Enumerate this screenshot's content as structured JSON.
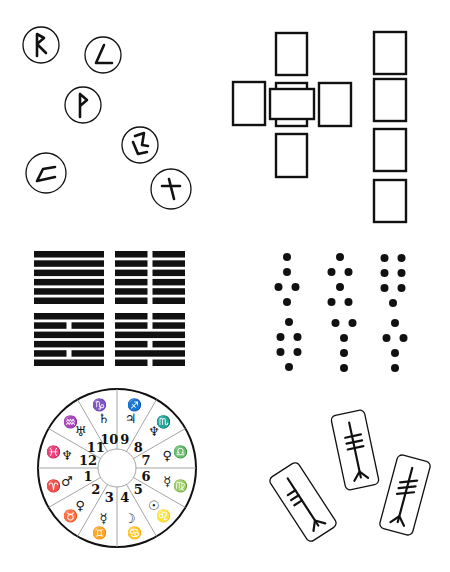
{
  "colors": {
    "ink": "#111111",
    "line": "#1a1a1a",
    "divider": "#9a9a9a",
    "background": "#ffffff"
  },
  "runes": {
    "panel_label": "rune-stones",
    "stones": [
      {
        "name": "raidho",
        "glyph": "ᚱ",
        "cx": 41,
        "cy": 45,
        "r": 18
      },
      {
        "name": "laguz-variant",
        "glyph": "ᚳ",
        "cx": 103,
        "cy": 55,
        "r": 18
      },
      {
        "name": "wunjo",
        "glyph": "ᚹ",
        "cx": 83,
        "cy": 105,
        "r": 18
      },
      {
        "name": "dagaz-variant",
        "glyph": "ᛞ",
        "cx": 140,
        "cy": 145,
        "r": 18
      },
      {
        "name": "kenaz-variant",
        "glyph": "ᚲ",
        "cx": 46,
        "cy": 173,
        "r": 20
      },
      {
        "name": "gebo",
        "glyph": "ᚷ",
        "cx": 171,
        "cy": 189,
        "r": 20
      }
    ]
  },
  "tarot": {
    "panel_label": "celtic-cross-spread",
    "cross_cards": [
      {
        "position": "top",
        "x": 276,
        "y": 33,
        "w": 31,
        "h": 42
      },
      {
        "position": "left",
        "x": 233,
        "y": 82,
        "w": 32,
        "h": 43
      },
      {
        "position": "center",
        "x": 276,
        "y": 83,
        "w": 31,
        "h": 43
      },
      {
        "position": "crossing",
        "x": 270,
        "y": 89,
        "w": 44,
        "h": 30
      },
      {
        "position": "right",
        "x": 319,
        "y": 83,
        "w": 32,
        "h": 43
      },
      {
        "position": "bottom",
        "x": 276,
        "y": 134,
        "w": 31,
        "h": 43
      }
    ],
    "staff_cards": [
      {
        "position": "staff-1",
        "x": 374,
        "y": 32,
        "w": 32,
        "h": 42
      },
      {
        "position": "staff-2",
        "x": 374,
        "y": 79,
        "w": 32,
        "h": 42
      },
      {
        "position": "staff-3",
        "x": 374,
        "y": 129,
        "w": 32,
        "h": 42
      },
      {
        "position": "staff-4",
        "x": 374,
        "y": 180,
        "w": 32,
        "h": 42
      }
    ]
  },
  "iching": {
    "panel_label": "i-ching-hexagrams",
    "hexagrams": [
      {
        "name": "qian",
        "x": 34,
        "y": 251,
        "lines": [
          "solid",
          "solid",
          "solid",
          "solid",
          "solid",
          "solid"
        ]
      },
      {
        "name": "kun",
        "x": 115,
        "y": 251,
        "lines": [
          "broken",
          "broken",
          "broken",
          "broken",
          "broken",
          "broken"
        ]
      },
      {
        "name": "li",
        "x": 34,
        "y": 313,
        "lines": [
          "solid",
          "broken",
          "solid",
          "solid",
          "broken",
          "solid"
        ]
      },
      {
        "name": "hexagram-broken-mix",
        "x": 115,
        "y": 313,
        "lines": [
          "broken",
          "broken",
          "solid",
          "broken",
          "solid",
          "broken"
        ]
      }
    ]
  },
  "geomancy": {
    "panel_label": "geomantic-figures",
    "figures": [
      {
        "name": "figure-1",
        "cx": 287,
        "cy": 257,
        "rows": [
          1,
          1,
          2,
          1
        ]
      },
      {
        "name": "figure-2",
        "cx": 340,
        "cy": 257,
        "rows": [
          1,
          2,
          1,
          2
        ]
      },
      {
        "name": "figure-3",
        "cx": 393,
        "cy": 258,
        "rows": [
          2,
          2,
          2,
          1
        ]
      },
      {
        "name": "figure-4",
        "cx": 289,
        "cy": 322,
        "rows": [
          1,
          2,
          2,
          1
        ]
      },
      {
        "name": "figure-5",
        "cx": 344,
        "cy": 323,
        "rows": [
          2,
          1,
          1,
          1
        ]
      },
      {
        "name": "figure-6",
        "cx": 395,
        "cy": 323,
        "rows": [
          1,
          2,
          1,
          1
        ]
      }
    ]
  },
  "astrology": {
    "panel_label": "natal-chart-wheel",
    "center": {
      "x": 117,
      "y": 468
    },
    "outer_radius": 79,
    "inner_radius": 19,
    "houses": [
      {
        "number": "1",
        "sign": "♈",
        "planet": "♂"
      },
      {
        "number": "2",
        "sign": "♉",
        "planet": "♀"
      },
      {
        "number": "3",
        "sign": "♊",
        "planet": "☿"
      },
      {
        "number": "4",
        "sign": "♋",
        "planet": "☽"
      },
      {
        "number": "5",
        "sign": "♌",
        "planet": "☉"
      },
      {
        "number": "6",
        "sign": "♍",
        "planet": "☿"
      },
      {
        "number": "7",
        "sign": "♎",
        "planet": "♀"
      },
      {
        "number": "8",
        "sign": "♏",
        "planet": "♆"
      },
      {
        "number": "9",
        "sign": "♐",
        "planet": "♃"
      },
      {
        "number": "10",
        "sign": "♑",
        "planet": "♄"
      },
      {
        "number": "11",
        "sign": "♒",
        "planet": "♅"
      },
      {
        "number": "12",
        "sign": "♓",
        "planet": "♆"
      }
    ]
  },
  "ogham": {
    "panel_label": "ogham-staves",
    "staves": [
      {
        "name": "stave-left",
        "cx": 303,
        "cy": 502,
        "w": 34,
        "h": 76,
        "rotate": -33,
        "strokes": 3,
        "stroke_side": "left"
      },
      {
        "name": "stave-middle",
        "cx": 355,
        "cy": 450,
        "w": 34,
        "h": 76,
        "rotate": -12,
        "strokes": 3,
        "stroke_side": "right"
      },
      {
        "name": "stave-right",
        "cx": 405,
        "cy": 495,
        "w": 34,
        "h": 76,
        "rotate": 15,
        "strokes": 3,
        "stroke_side": "across"
      }
    ]
  }
}
